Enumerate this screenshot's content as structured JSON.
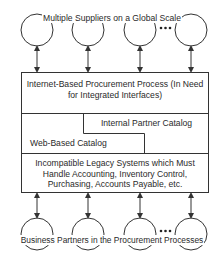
{
  "diagram": {
    "top_label": "Multiple Suppliers on a Global Scale",
    "bottom_label": "Business Partners in the Procurement Processes",
    "ellipsis": "•••",
    "layers": {
      "internet_procurement": "Internet-Based Procurement Process (In Need for Integrated Interfaces)",
      "internal_partner_catalog": "Internal Partner Catalog",
      "web_based_catalog": "Web-Based Catalog",
      "legacy_systems": "Incompatible Legacy Systems which Must Handle Accounting, Inventory Control, Purchasing, Accounts Payable, etc."
    },
    "top_nodes": [
      "Supplier 1",
      "Supplier 2",
      "Supplier 3",
      "Supplier N"
    ],
    "bottom_nodes": [
      "Partner 1",
      "Partner 2",
      "Partner 3",
      "Partner N"
    ],
    "colors": {
      "line": "#333333",
      "background": "#ffffff"
    }
  }
}
